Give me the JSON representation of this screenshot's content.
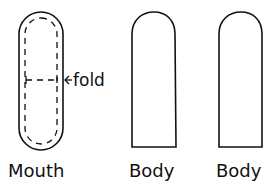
{
  "diagram": {
    "stroke_color": "#111111",
    "background": "#ffffff",
    "pieces": [
      {
        "name": "mouth",
        "label": "Mouth",
        "shape": "stadium-with-dashed-inner-outline"
      },
      {
        "name": "body-1",
        "label": "Body",
        "shape": "rounded-top-rectangle"
      },
      {
        "name": "body-2",
        "label": "Body",
        "shape": "rounded-top-rectangle"
      }
    ],
    "annotations": {
      "fold_label": "fold",
      "fold_arrow": "←"
    }
  }
}
